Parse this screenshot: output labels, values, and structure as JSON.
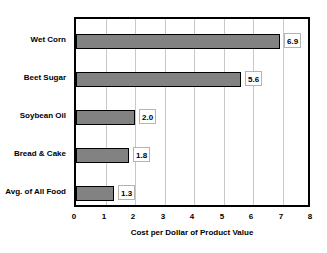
{
  "chart_data": {
    "type": "bar",
    "orientation": "horizontal",
    "title": "",
    "xlabel": "Cost per Dollar of Product Value",
    "ylabel": "",
    "categories": [
      "Wet Corn",
      "Beet Sugar",
      "Soybean Oil",
      "Bread & Cake",
      "Avg. of All Food"
    ],
    "values": [
      6.9,
      5.6,
      2.0,
      1.8,
      1.3
    ],
    "value_labels": [
      "6.9",
      "5.6",
      "2.0",
      "1.8",
      "1.3"
    ],
    "xlim": [
      0,
      8
    ],
    "xticks": [
      0,
      1,
      2,
      3,
      4,
      5,
      6,
      7,
      8
    ],
    "xtick_labels": [
      "0",
      "1",
      "2",
      "3",
      "4",
      "5",
      "6",
      "7",
      "8"
    ],
    "grid": "vertical",
    "legend": "none",
    "colors": {
      "bar_fill": "#828282",
      "bar_border": "#000000",
      "gridline": "#c8c8c8",
      "frame": "#000000",
      "text": "#000000",
      "background": "#ffffff"
    }
  }
}
